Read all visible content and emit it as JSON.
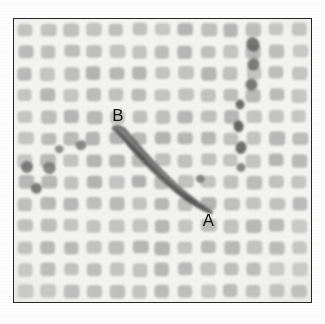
{
  "figure": {
    "kind": "micrograph",
    "frame": {
      "border_color": "#262626",
      "x": 13,
      "y": 18,
      "width": 299,
      "height": 285
    },
    "background_color": "#fdfdfd",
    "plate_background_color": "#f3f3f1"
  },
  "mesh": {
    "name": "woven-square-mesh",
    "columns": 13,
    "rows": 13,
    "pad_color": "#a9a9a9",
    "gap_color": "#f4f4f2",
    "pad_corner_radius_px": 4,
    "weave_texture": "cross-hatch"
  },
  "labels": [
    {
      "id": "label-b",
      "text": "B",
      "x": 112,
      "y": 104,
      "color": "#111111",
      "font_size_px": 17
    },
    {
      "id": "label-a",
      "text": "A",
      "x": 203,
      "y": 209,
      "color": "#111111",
      "font_size_px": 17
    }
  ],
  "fiber": {
    "name": "diagonal-fiber",
    "color": "#5a5a5a",
    "start_label": "B",
    "end_label": "A",
    "start_point": {
      "x": 112,
      "y": 126
    },
    "end_point": {
      "x": 209,
      "y": 199
    },
    "max_width_px": 9
  },
  "debris": [
    {
      "x": 247,
      "y": 36,
      "w": 13,
      "h": 15,
      "shade": "#4f4f4f"
    },
    {
      "x": 248,
      "y": 57,
      "w": 12,
      "h": 13,
      "shade": "#5a5a5a"
    },
    {
      "x": 246,
      "y": 78,
      "w": 12,
      "h": 12,
      "shade": "#575757"
    },
    {
      "x": 236,
      "y": 99,
      "w": 9,
      "h": 10,
      "shade": "#4a4a4a"
    },
    {
      "x": 234,
      "y": 120,
      "w": 10,
      "h": 12,
      "shade": "#444444"
    },
    {
      "x": 236,
      "y": 141,
      "w": 11,
      "h": 13,
      "shade": "#4d4d4d"
    },
    {
      "x": 237,
      "y": 163,
      "w": 9,
      "h": 9,
      "shade": "#6a6a6a"
    },
    {
      "x": 20,
      "y": 161,
      "w": 12,
      "h": 12,
      "shade": "#5d5d5d"
    },
    {
      "x": 42,
      "y": 162,
      "w": 13,
      "h": 12,
      "shade": "#6a6a6a"
    },
    {
      "x": 30,
      "y": 183,
      "w": 11,
      "h": 11,
      "shade": "#595959"
    },
    {
      "x": 75,
      "y": 140,
      "w": 11,
      "h": 10,
      "shade": "#6e6e6e"
    },
    {
      "x": 54,
      "y": 145,
      "w": 9,
      "h": 8,
      "shade": "#757575"
    },
    {
      "x": 196,
      "y": 175,
      "w": 9,
      "h": 8,
      "shade": "#6c6c6c"
    }
  ],
  "caption_remnant": {
    "visible_fragment": "◦  ◦      ◦",
    "note": "tops of a clipped caption line below the plate"
  }
}
